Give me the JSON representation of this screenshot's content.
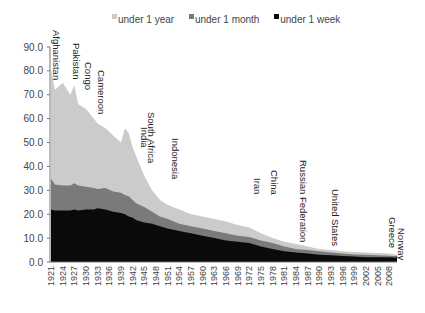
{
  "chart_data": {
    "type": "area",
    "stacked": true,
    "title": "",
    "xlabel": "",
    "ylabel": "",
    "ylim": [
      0,
      90
    ],
    "yticks": [
      "0.0",
      "10.0",
      "20.0",
      "30.0",
      "40.0",
      "50.0",
      "60.0",
      "70.0",
      "80.0",
      "90.0"
    ],
    "xticks": [
      "1921",
      "1924",
      "1927",
      "1930",
      "1933",
      "1936",
      "1939",
      "1942",
      "1945",
      "1948",
      "1951",
      "1954",
      "1957",
      "1960",
      "1963",
      "1966",
      "1969",
      "1972",
      "1975",
      "1978",
      "1981",
      "1984",
      "1987",
      "1990",
      "1993",
      "1996",
      "1999",
      "2002",
      "2005",
      "2008"
    ],
    "legend_position": "top",
    "x": [
      1921,
      1922,
      1924,
      1926,
      1927,
      1928,
      1930,
      1932,
      1933,
      1935,
      1937,
      1939,
      1940,
      1941,
      1942,
      1943,
      1945,
      1947,
      1949,
      1951,
      1954,
      1957,
      1960,
      1963,
      1966,
      1969,
      1972,
      1975,
      1978,
      1981,
      1984,
      1987,
      1990,
      1993,
      1996,
      1999,
      2002,
      2005,
      2008,
      2010
    ],
    "series": [
      {
        "name": "under 1 week",
        "color": "#0a0a0a",
        "values": [
          22,
          21.5,
          21.5,
          21.5,
          22,
          21.5,
          22,
          22,
          22.5,
          22,
          21,
          20.5,
          20,
          19,
          18.5,
          17.5,
          16.5,
          16,
          15,
          14,
          13,
          12,
          11,
          10,
          9,
          8.5,
          8,
          6.5,
          5.5,
          4.5,
          4,
          3.5,
          3,
          2.8,
          2.5,
          2.3,
          2,
          2,
          2,
          1.8
        ]
      },
      {
        "name": "under 1 month",
        "color": "#7a7a7a",
        "values": [
          35,
          32.5,
          32,
          32,
          33,
          32,
          31.5,
          31,
          30.5,
          31,
          29.5,
          29,
          28,
          27.5,
          26,
          24.5,
          23,
          21,
          19,
          18,
          16,
          15,
          14,
          13,
          12,
          11,
          10.5,
          9,
          8,
          6.5,
          5.5,
          5,
          4.5,
          4,
          3.5,
          3.2,
          3,
          2.8,
          2.6,
          2.4
        ]
      },
      {
        "name": "under 1 year",
        "color": "#cbcbcb",
        "values": [
          81,
          72,
          75,
          70,
          74,
          66,
          64,
          60,
          58,
          56,
          53,
          50,
          56,
          54,
          48,
          44,
          36,
          30,
          26,
          24,
          22,
          20,
          19,
          18,
          17,
          15.5,
          14.5,
          12,
          10,
          8.5,
          7.5,
          6.5,
          5.5,
          5,
          4.5,
          4.2,
          4,
          3.8,
          3.5,
          3.2
        ]
      }
    ],
    "annotations": [
      {
        "label": "Afghanistan",
        "year": 1921
      },
      {
        "label": "Pakistan",
        "year": 1927
      },
      {
        "label": "Congo",
        "year": 1929
      },
      {
        "label": "Cameroon",
        "year": 1931
      },
      {
        "label": "India",
        "year": 1946
      },
      {
        "label": "South Africa",
        "year": 1947
      },
      {
        "label": "Indonesia",
        "year": 1950
      },
      {
        "label": "Iran",
        "year": 1973
      },
      {
        "label": "China",
        "year": 1975
      },
      {
        "label": "Russian Federation",
        "year": 1986
      },
      {
        "label": "United States",
        "year": 1995
      },
      {
        "label": "Greece",
        "year": 2007
      },
      {
        "label": "Norway",
        "year": 2008
      }
    ]
  },
  "legend": {
    "items": [
      {
        "label": "under 1 year",
        "color": "#cbcbcb"
      },
      {
        "label": "under 1 month",
        "color": "#7a7a7a"
      },
      {
        "label": "under 1 week",
        "color": "#0a0a0a"
      }
    ]
  }
}
